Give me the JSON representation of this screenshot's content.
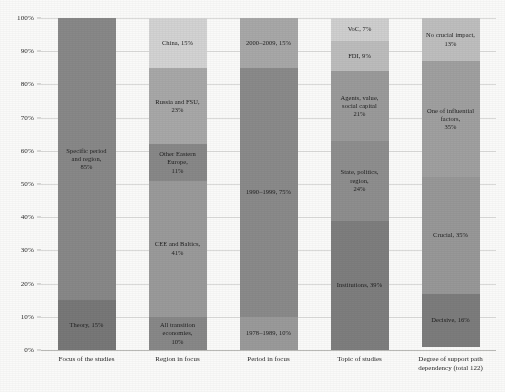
{
  "chart_data": {
    "type": "bar",
    "subtype": "100% stacked column",
    "title": "",
    "xlabel": "",
    "ylabel": "",
    "ylim": [
      0,
      100
    ],
    "grid": true,
    "legend": "none (segments labelled in place)",
    "ytick_labels": [
      "100%",
      "90%",
      "80%",
      "70%",
      "60%",
      "50%",
      "40%",
      "30%",
      "20%",
      "10%",
      "0%"
    ],
    "ytick_values": [
      100,
      90,
      80,
      70,
      60,
      50,
      40,
      30,
      20,
      10,
      0
    ],
    "categories": [
      "Focus of the studies",
      "Region in focus",
      "Period in focus",
      "Topic of studies",
      "Degree of support path\ndependency (total 122)"
    ],
    "columns": [
      {
        "category": "Focus of the studies",
        "segments": [
          {
            "name": "Specific period and region",
            "value": 85,
            "label": "Specific period\nand region,\n85%",
            "color": "#878787"
          },
          {
            "name": "Theory",
            "value": 15,
            "label": "Theory, 15%",
            "color": "#767676"
          }
        ]
      },
      {
        "category": "Region in focus",
        "segments": [
          {
            "name": "China",
            "value": 15,
            "label": "China, 15%",
            "color": "#d4d4d4"
          },
          {
            "name": "Russia and FSU",
            "value": 23,
            "label": "Russia and FSU, 23%",
            "color": "#a8a8a8"
          },
          {
            "name": "Other Eastern Europe",
            "value": 11,
            "label": "Other Eastern Europe,\n11%",
            "color": "#878787"
          },
          {
            "name": "CEE and Baltics",
            "value": 41,
            "label": "CEE and Baltics,\n41%",
            "color": "#9a9a9a"
          },
          {
            "name": "All transition economies",
            "value": 10,
            "label": "All transition economies,\n10%",
            "color": "#878787"
          }
        ]
      },
      {
        "category": "Period in focus",
        "segments": [
          {
            "name": "2000-2009",
            "value": 15,
            "label": "2000–2009, 15%",
            "color": "#a8a8a8"
          },
          {
            "name": "1990-1999",
            "value": 75,
            "label": "1990–1999, 75%",
            "color": "#898989"
          },
          {
            "name": "1978-1989",
            "value": 10,
            "label": "1978–1989, 10%",
            "color": "#9a9a9a"
          }
        ]
      },
      {
        "category": "Topic of studies",
        "segments": [
          {
            "name": "VoC",
            "value": 7,
            "label": "VoC, 7%",
            "color": "#d0d0d0"
          },
          {
            "name": "FDI",
            "value": 9,
            "label": "FDI, 9%",
            "color": "#bdbdbd"
          },
          {
            "name": "Agents, value, social capital",
            "value": 21,
            "label": "Agents, value,\nsocial capital\n21%",
            "color": "#9a9a9a"
          },
          {
            "name": "State, politics, region",
            "value": 24,
            "label": "State, politics, region,\n24%",
            "color": "#8d8d8d"
          },
          {
            "name": "Institutions",
            "value": 39,
            "label": "Institutions, 39%",
            "color": "#7d7d7d"
          }
        ]
      },
      {
        "category": "Degree of support path dependency (total 122)",
        "segments": [
          {
            "name": "No crucial impact",
            "value": 13,
            "label": "No crucial impact,\n13%",
            "color": "#bfbfbf"
          },
          {
            "name": "One of influential factors",
            "value": 35,
            "label": "One of influential\nfactors,\n35%",
            "color": "#a0a0a0"
          },
          {
            "name": "Crucial",
            "value": 35,
            "label": "Crucial, 35%",
            "color": "#979797"
          },
          {
            "name": "Decisive",
            "value": 16,
            "label": "Decisive, 16%",
            "color": "#7b7b7b"
          }
        ]
      }
    ]
  }
}
